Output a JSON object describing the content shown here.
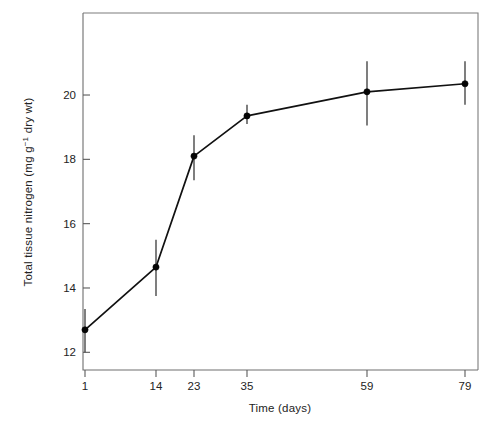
{
  "chart_data": {
    "type": "line",
    "title": "",
    "subtitle": "",
    "xlabel": "Time (days)",
    "ylabel": "Total tissue nitrogen (mg g⁻¹ dry wt)",
    "ylabel_parts": {
      "before": "Total tissue nitrogen (mg g",
      "superscript": "−1",
      "after": " dry wt)"
    },
    "categories": [
      "1",
      "14",
      "23",
      "35",
      "59",
      "79"
    ],
    "x": [
      1,
      14,
      23,
      35,
      59,
      79
    ],
    "values": [
      12.7,
      14.65,
      18.1,
      19.35,
      20.1,
      20.35
    ],
    "error_low": [
      12.0,
      13.75,
      17.35,
      19.1,
      19.05,
      19.7
    ],
    "error_high": [
      13.35,
      15.5,
      18.75,
      19.7,
      21.05,
      21.05
    ],
    "series": [
      {
        "name": "Total tissue nitrogen",
        "values": [
          12.7,
          14.65,
          18.1,
          19.35,
          20.1,
          20.35
        ],
        "marker": "filled-circle",
        "color": "#050505"
      }
    ],
    "ylim": [
      11.45,
      22.55
    ],
    "yticks": [
      12,
      14,
      16,
      18,
      20
    ],
    "ytick_labels": [
      "12",
      "14",
      "16",
      "18",
      "20"
    ],
    "xtick_labels": [
      "1",
      "14",
      "23",
      "35",
      "59",
      "79"
    ],
    "grid": false,
    "legend": false,
    "legend_position": "none",
    "frame": "box",
    "error_bar_style": "vertical-line-no-caps",
    "axis_color": "#6e6e6e",
    "line_color": "#111111",
    "background_color": "#ffffff"
  },
  "figure": {
    "caption": "",
    "annotations": []
  }
}
